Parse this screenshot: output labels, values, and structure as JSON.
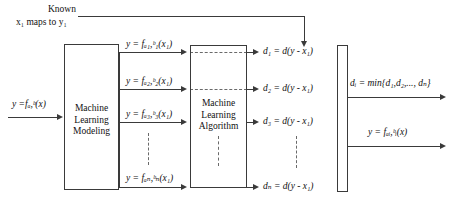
{
  "diagram": {
    "title_note": {
      "line1": "Known",
      "line2": "x₁ maps to y₁"
    },
    "input": {
      "label": "y =fₐ,ᵇ(x)"
    },
    "boxes": {
      "modeling": {
        "line1": "Machine",
        "line2": "Learning",
        "line3": "Modeling"
      },
      "algorithm": {
        "line1": "Machine",
        "line2": "Learning",
        "line3": "Algorithm"
      },
      "selector": {
        "label": ""
      }
    },
    "model_branches": [
      {
        "label": "y = fₐ₁,ᵇ₁(x₁)"
      },
      {
        "label": "y = fₐ₂,ᵇ₂(x₁)"
      },
      {
        "label": "y = fₐ₃,ᵇ₃(x₁)"
      },
      {
        "label": "y = fₐₙ,ᵇₙ(x₁)"
      }
    ],
    "distances": [
      {
        "label": "d₁ = d(y - x₁)"
      },
      {
        "label": "d₂ = d(y - x₁)"
      },
      {
        "label": "d₃ = d(y - x₁)"
      },
      {
        "label": "dₙ = d(y - x₁)"
      }
    ],
    "outputs": {
      "min_label": "dᵢ = min{d₁,d₂,..., dₙ}",
      "function_label": "y = fₐᵢ,ᵇᵢ(x)"
    },
    "ellipsis_marker": "⋮",
    "colors": {
      "stroke": "#3a3a3a",
      "dashed": "#6a6a6a",
      "text": "#111111",
      "background": "#ffffff"
    }
  }
}
